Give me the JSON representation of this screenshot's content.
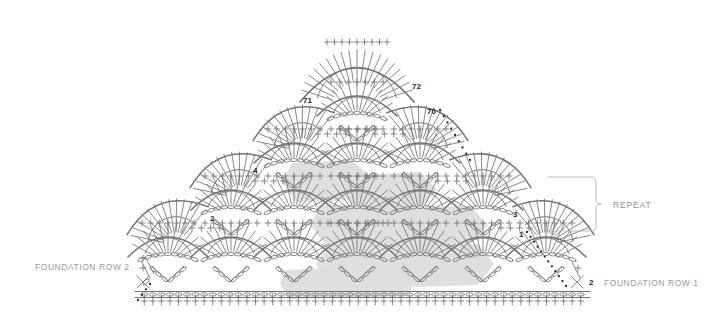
{
  "diagram": {
    "type": "crochet-symbol-chart",
    "background_color": "#ffffff",
    "stitch_line_color": "#6f7377",
    "shade_color": "#dcdcdc",
    "label_color": "#9a9a9a",
    "number_color": "#1c1c1c"
  },
  "labels": {
    "foundation_row_2": "FOUNDATION ROW 2",
    "foundation_row_1": "FOUNDATION ROW 1",
    "repeat": "REPEAT"
  },
  "row_numbers": [
    {
      "text": "71",
      "x": 303,
      "y": 96
    },
    {
      "text": "72",
      "x": 412,
      "y": 82
    },
    {
      "text": "70",
      "x": 427,
      "y": 107
    },
    {
      "text": "4",
      "x": 253,
      "y": 166
    },
    {
      "text": "2",
      "x": 210,
      "y": 214
    },
    {
      "text": "3",
      "x": 513,
      "y": 210
    },
    {
      "text": "1",
      "x": 519,
      "y": 230
    },
    {
      "text": "2",
      "x": 589,
      "y": 278
    }
  ],
  "chart_data": {
    "type": "diagram",
    "shape": "triangular-shawl",
    "tiers": 4,
    "fans_per_tier": [
      7,
      5,
      3,
      1
    ],
    "foundation_chain_stitches": 48,
    "repeat_bracket": {
      "x": 596,
      "y_top": 177,
      "y_bottom": 231
    },
    "legend": [
      {
        "symbol": "oval",
        "name": "chain-stitch"
      },
      {
        "symbol": "cross",
        "name": "single-crochet"
      },
      {
        "symbol": "bar-with-slash",
        "name": "double-crochet"
      },
      {
        "symbol": "dot",
        "name": "slip-stitch"
      }
    ]
  }
}
